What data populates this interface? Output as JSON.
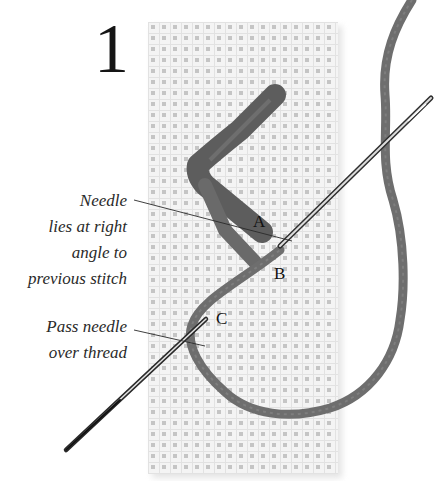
{
  "figure": {
    "step_number": "1",
    "palette": {
      "background": "#ffffff",
      "fabric": "#f2f2f2",
      "fabric_holes": "#b9b9b9",
      "thread": "#6e6e6e",
      "needle": "#3a3a3a",
      "text": "#2a2a2a"
    },
    "point_labels": {
      "a": "A",
      "b": "B",
      "c": "C"
    },
    "annotations": {
      "needle_angle": {
        "lines": [
          "Needle",
          "lies at right",
          "angle to",
          "previous stitch"
        ],
        "points_to": "A"
      },
      "pass_needle": {
        "lines": [
          "Pass needle",
          "over thread"
        ],
        "points_to": "C"
      }
    },
    "icons": {
      "fabric": "canvas-fabric-swatch",
      "thread": "embroidery-thread",
      "needle": "needle-icon"
    }
  }
}
